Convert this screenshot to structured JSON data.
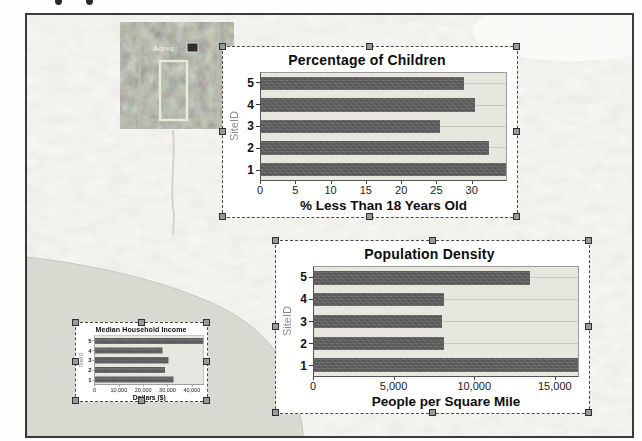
{
  "map": {
    "photo_label": "Acres",
    "water_color": "#d8d9d0",
    "terrain_base": "#f3f2ec"
  },
  "chart_data": [
    {
      "type": "bar",
      "orientation": "horizontal",
      "title": "Percentage of Children",
      "ylabel": "SiteID",
      "xlabel": "% Less Than 18 Years Old",
      "categories": [
        "5",
        "4",
        "3",
        "2",
        "1"
      ],
      "values": [
        29,
        30.5,
        25.5,
        32.5,
        35
      ],
      "xlim": [
        0,
        35
      ],
      "xticks": [
        {
          "value": 0,
          "label": "0"
        },
        {
          "value": 5,
          "label": "5"
        },
        {
          "value": 10,
          "label": "10"
        },
        {
          "value": 15,
          "label": "15"
        },
        {
          "value": 20,
          "label": "20"
        },
        {
          "value": 25,
          "label": "25"
        },
        {
          "value": 30,
          "label": "30"
        }
      ],
      "bar_color": "#575757",
      "plot_bg": "#e7e7df",
      "grid": "horizontal-category-lines",
      "legend": "none"
    },
    {
      "type": "bar",
      "orientation": "horizontal",
      "title": "Population Density",
      "ylabel": "SiteID",
      "xlabel": "People per Square Mile",
      "categories": [
        "5",
        "4",
        "3",
        "2",
        "1"
      ],
      "values": [
        13500,
        8100,
        8000,
        8100,
        16500
      ],
      "xlim": [
        0,
        16500
      ],
      "xticks": [
        {
          "value": 0,
          "label": "0"
        },
        {
          "value": 5000,
          "label": "5,000"
        },
        {
          "value": 10000,
          "label": "10,000"
        },
        {
          "value": 15000,
          "label": "15,000"
        }
      ],
      "bar_color": "#575757",
      "plot_bg": "#e7e7df",
      "grid": "horizontal-category-lines",
      "legend": "none"
    },
    {
      "type": "bar",
      "orientation": "horizontal",
      "title": "Median Household Income",
      "ylabel": "SiteID",
      "xlabel": "Dollars ($)",
      "categories": [
        "5",
        "4",
        "3",
        "2",
        "1"
      ],
      "values": [
        45000,
        28000,
        30500,
        29000,
        32500
      ],
      "xlim": [
        0,
        45000
      ],
      "xticks": [
        {
          "value": 0,
          "label": "0"
        },
        {
          "value": 10000,
          "label": "10,000"
        },
        {
          "value": 20000,
          "label": "20,000"
        },
        {
          "value": 30000,
          "label": "30,000"
        },
        {
          "value": 40000,
          "label": "40,000"
        }
      ],
      "bar_color": "#575757",
      "plot_bg": "#e7e7df",
      "grid": "none",
      "legend": "none"
    }
  ]
}
